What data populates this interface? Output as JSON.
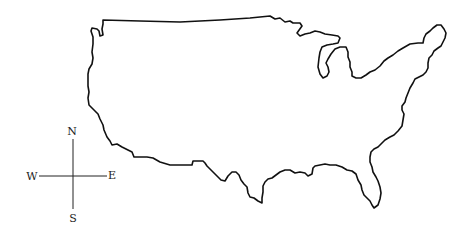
{
  "map": {
    "subject": "Outline map of the contiguous United States",
    "outline_color": "#111111",
    "background_color": "#ffffff"
  },
  "compass": {
    "north": "N",
    "south": "S",
    "east": "E",
    "west": "W"
  }
}
